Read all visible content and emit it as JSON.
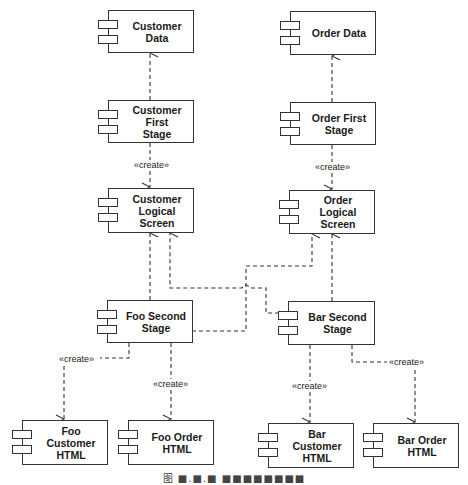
{
  "diagram": {
    "type": "UML component diagram",
    "components": {
      "customer_data": {
        "label": "Customer Data"
      },
      "order_data": {
        "label": "Order Data"
      },
      "customer_first_stage": {
        "label": "Customer First\nStage"
      },
      "order_first_stage": {
        "label": "Order First\nStage"
      },
      "customer_logical_screen": {
        "label": "Customer\nLogical Screen"
      },
      "order_logical_screen": {
        "label": "Order Logical\nScreen"
      },
      "foo_second_stage": {
        "label": "Foo Second\nStage"
      },
      "bar_second_stage": {
        "label": "Bar Second\nStage"
      },
      "foo_customer_html": {
        "label": "Foo Customer\nHTML"
      },
      "foo_order_html": {
        "label": "Foo Order\nHTML"
      },
      "bar_customer_html": {
        "label": "Bar Customer\nHTML"
      },
      "bar_order_html": {
        "label": "Bar Order\nHTML"
      }
    },
    "stereotypes": {
      "customer_create": "«create»",
      "order_create": "«create»",
      "foo_customer_create": "«create»",
      "foo_order_create": "«create»",
      "bar_customer_create": "«create»",
      "bar_order_create": "«create»"
    },
    "dependencies": [
      {
        "from": "Customer First Stage",
        "to": "Customer Data",
        "stereotype": ""
      },
      {
        "from": "Order First Stage",
        "to": "Order Data",
        "stereotype": ""
      },
      {
        "from": "Customer First Stage",
        "to": "Customer Logical Screen",
        "stereotype": "«create»"
      },
      {
        "from": "Order First Stage",
        "to": "Order Logical Screen",
        "stereotype": "«create»"
      },
      {
        "from": "Foo Second Stage",
        "to": "Customer Logical Screen",
        "stereotype": ""
      },
      {
        "from": "Foo Second Stage",
        "to": "Order Logical Screen",
        "stereotype": ""
      },
      {
        "from": "Bar Second Stage",
        "to": "Customer Logical Screen",
        "stereotype": ""
      },
      {
        "from": "Bar Second Stage",
        "to": "Order Logical Screen",
        "stereotype": ""
      },
      {
        "from": "Foo Second Stage",
        "to": "Foo Customer HTML",
        "stereotype": "«create»"
      },
      {
        "from": "Foo Second Stage",
        "to": "Foo Order HTML",
        "stereotype": "«create»"
      },
      {
        "from": "Bar Second Stage",
        "to": "Bar Customer HTML",
        "stereotype": "«create»"
      },
      {
        "from": "Bar Second Stage",
        "to": "Bar Order HTML",
        "stereotype": "«create»"
      }
    ],
    "caption": "图 ■.■.■ ■■■■■■■■"
  }
}
